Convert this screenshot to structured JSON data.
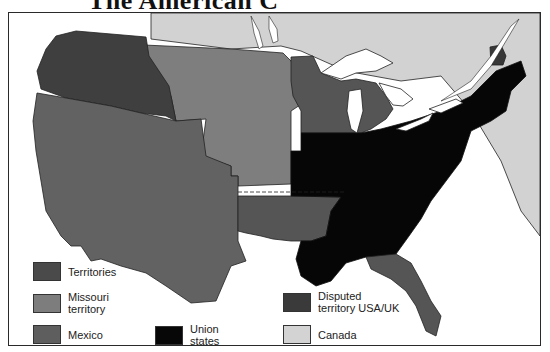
{
  "title": "The American C",
  "map": {
    "regions": {
      "territories": "#3f3f3f",
      "missouri_territory": "#7e7e7e",
      "mexico": "#626262",
      "union_states": "#060606",
      "disputed": "#383838",
      "canada": "#d2d2d2",
      "water": "#ffffff"
    }
  },
  "legend": {
    "items": [
      {
        "label": "Territories",
        "color": "#4a4a4a"
      },
      {
        "label": "Missouri territory",
        "color": "#7d7d7d"
      },
      {
        "label": "Mexico",
        "color": "#5e5e5e"
      },
      {
        "label": "Union states",
        "color": "#070707"
      },
      {
        "label": "Disputed territory USA/UK",
        "color": "#3a3a3a"
      },
      {
        "label": "Canada",
        "color": "#d3d3d3"
      }
    ],
    "territories": "Territories",
    "missouri_line1": "Missouri",
    "missouri_line2": "territory",
    "mexico": "Mexico",
    "union_line1": "Union",
    "union_line2": "states",
    "disputed_line1": "Disputed",
    "disputed_line2": "territory USA/UK",
    "canada": "Canada"
  }
}
